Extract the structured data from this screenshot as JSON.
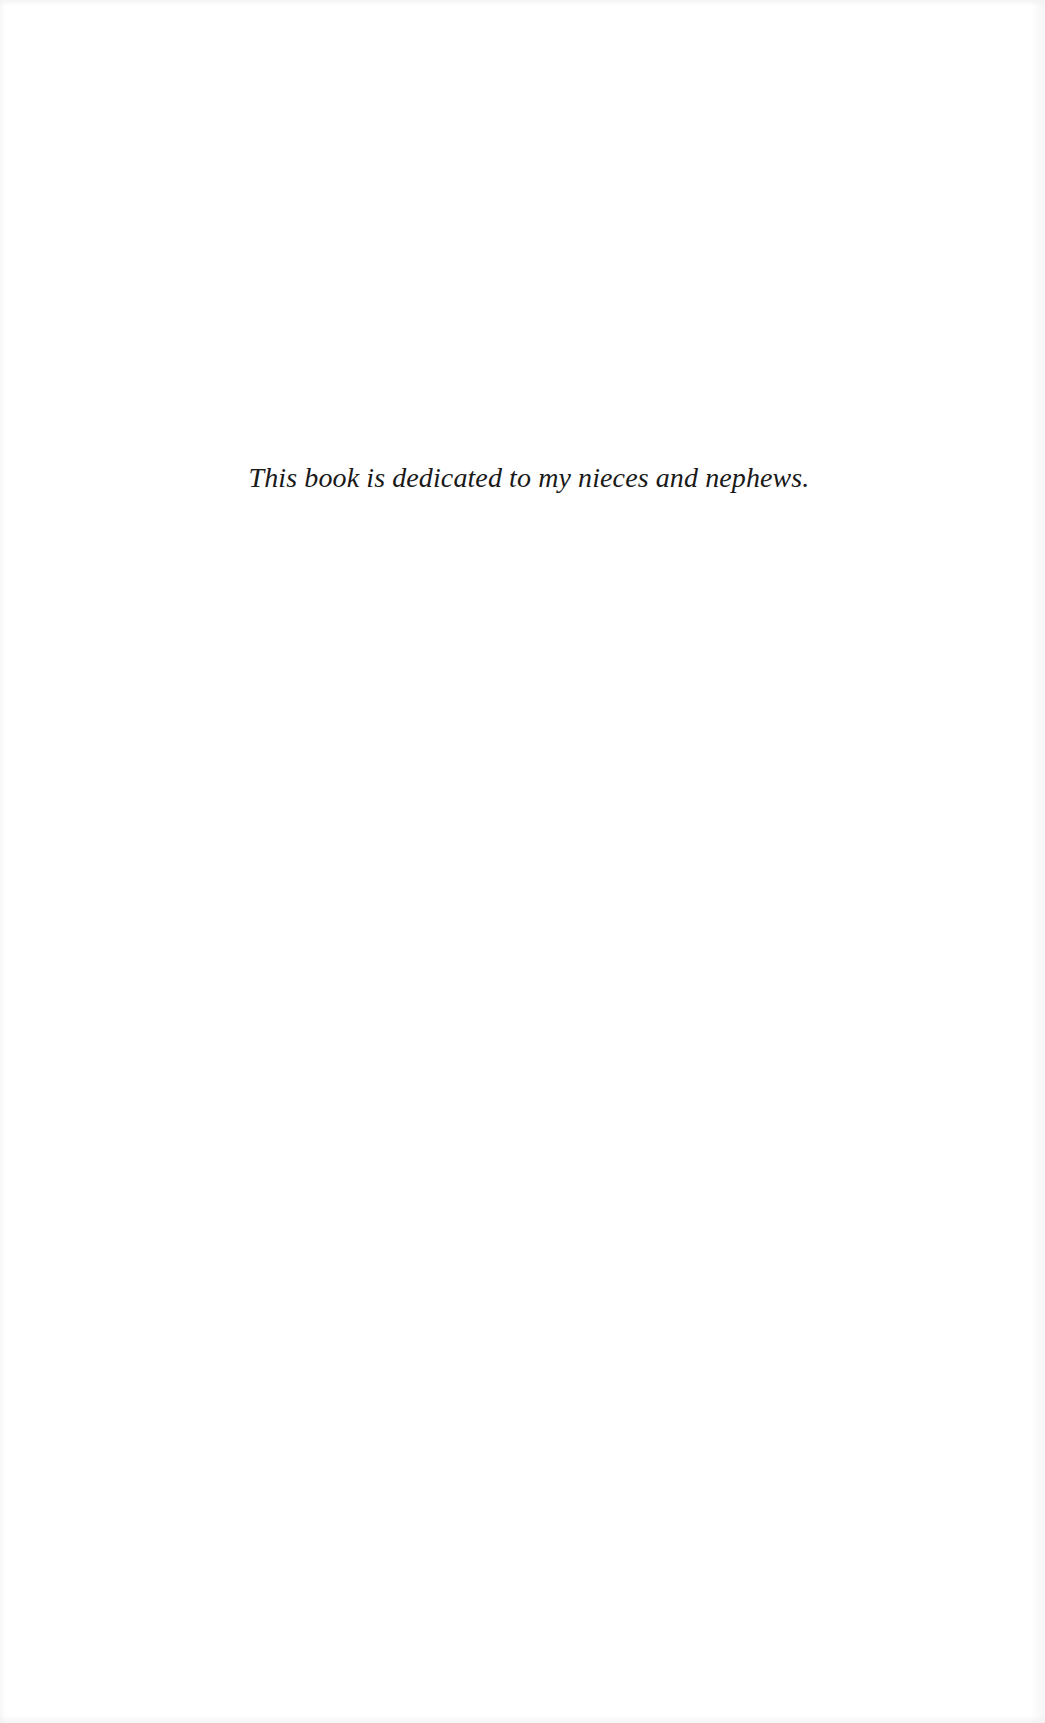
{
  "page": {
    "dedication": "This book is dedicated to my nieces and nephews."
  }
}
